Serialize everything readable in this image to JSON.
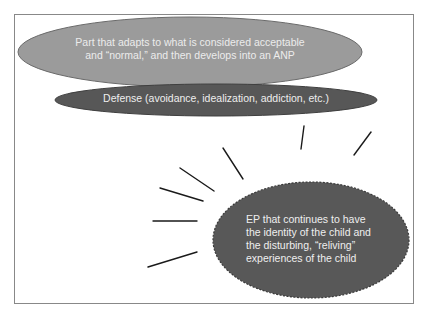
{
  "figure": {
    "frame": {
      "border_color": "#888888",
      "background": "#ffffff"
    },
    "shapes": {
      "anp_part": {
        "lines": [
          "Part that adapts to what is considered acceptable",
          "and “normal,” and then develops into an ANP"
        ],
        "fill": "#9b9b9b",
        "stroke": "#6a6a6a",
        "text_color": "#ececec"
      },
      "defense": {
        "text": "Defense (avoidance, idealization, addiction, etc.)",
        "fill": "#575757",
        "stroke": "#3f3f3f",
        "text_color": "#eeeeee"
      },
      "ep_part": {
        "lines": [
          "EP that continues to have",
          "the identity of the child and",
          "the disturbing,  “reliving”",
          "experiences of the child"
        ],
        "fill": "#585858",
        "stroke": "#3a3a3a",
        "stroke_style": "dashed",
        "text_color": "#efefef"
      }
    },
    "rays": {
      "count": 7,
      "color": "#1a1a1a",
      "meaning": "burst lines radiating from the EP part"
    }
  }
}
